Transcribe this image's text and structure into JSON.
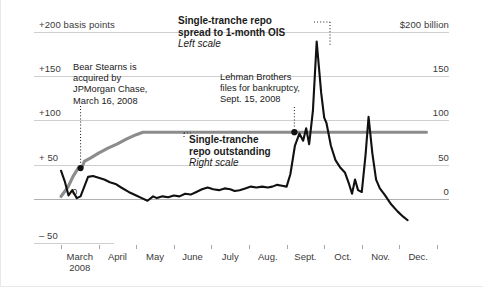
{
  "chart_data": {
    "type": "line",
    "title": "",
    "xlabel": "",
    "grid": true,
    "legend_position": "inline-annotations",
    "x_tick_labels": [
      "March\n2008",
      "April",
      "May",
      "June",
      "July",
      "Aug.",
      "Sept.",
      "Oct.",
      "Nov.",
      "Dec."
    ],
    "x_months": [
      "March",
      "April",
      "May",
      "June",
      "July",
      "Aug.",
      "Sept.",
      "Oct.",
      "Nov.",
      "Dec."
    ],
    "x_year_label": "2008",
    "left_axis": {
      "label": "basis points",
      "top_tick_label": "+200 basis points",
      "tick_labels": [
        "+200 basis points",
        "+150",
        "+100",
        "+ 50",
        "0",
        "– 50"
      ],
      "tick_values": [
        200,
        150,
        100,
        50,
        0,
        -50
      ],
      "ylim": [
        -50,
        200
      ],
      "unit": "basis points"
    },
    "right_axis": {
      "label": "$ billion",
      "top_tick_label": "$200 billion",
      "tick_labels": [
        "$200 billion",
        "150",
        "100",
        "50",
        "0"
      ],
      "tick_values": [
        200,
        150,
        100,
        50,
        0
      ],
      "ylim": [
        0,
        200
      ],
      "unit": "billions of dollars"
    },
    "series": [
      {
        "name": "Single-tranche repo spread to 1-month OIS",
        "scale": "left",
        "unit": "basis points",
        "color": "#111111",
        "label_line1": "Single-tranche repo",
        "label_line2": "spread to 1-month OIS",
        "label_scale": "Left scale",
        "points": [
          [
            0.0,
            32
          ],
          [
            0.1,
            20
          ],
          [
            0.2,
            4
          ],
          [
            0.3,
            10
          ],
          [
            0.42,
            1
          ],
          [
            0.52,
            3
          ],
          [
            0.62,
            14
          ],
          [
            0.72,
            25
          ],
          [
            0.85,
            26
          ],
          [
            1.0,
            24
          ],
          [
            1.15,
            22
          ],
          [
            1.3,
            19
          ],
          [
            1.45,
            17
          ],
          [
            1.6,
            13
          ],
          [
            1.8,
            8
          ],
          [
            2.0,
            4
          ],
          [
            2.15,
            1
          ],
          [
            2.3,
            -2
          ],
          [
            2.45,
            3
          ],
          [
            2.55,
            1
          ],
          [
            2.7,
            3
          ],
          [
            2.85,
            2
          ],
          [
            3.0,
            4
          ],
          [
            3.15,
            3
          ],
          [
            3.3,
            6
          ],
          [
            3.45,
            5
          ],
          [
            3.6,
            8
          ],
          [
            3.75,
            11
          ],
          [
            3.9,
            13
          ],
          [
            4.05,
            11
          ],
          [
            4.2,
            10
          ],
          [
            4.35,
            12
          ],
          [
            4.5,
            11
          ],
          [
            4.62,
            9
          ],
          [
            4.75,
            10
          ],
          [
            4.9,
            12
          ],
          [
            5.05,
            14
          ],
          [
            5.2,
            13
          ],
          [
            5.35,
            14
          ],
          [
            5.5,
            13
          ],
          [
            5.62,
            14
          ],
          [
            5.75,
            16
          ],
          [
            5.88,
            15
          ],
          [
            6.0,
            14
          ],
          [
            6.1,
            28
          ],
          [
            6.22,
            60
          ],
          [
            6.34,
            74
          ],
          [
            6.44,
            66
          ],
          [
            6.52,
            80
          ],
          [
            6.6,
            62
          ],
          [
            6.7,
            100
          ],
          [
            6.8,
            178
          ],
          [
            6.92,
            120
          ],
          [
            7.0,
            92
          ],
          [
            7.06,
            86
          ],
          [
            7.18,
            60
          ],
          [
            7.3,
            44
          ],
          [
            7.42,
            36
          ],
          [
            7.55,
            30
          ],
          [
            7.66,
            17
          ],
          [
            7.74,
            6
          ],
          [
            7.82,
            22
          ],
          [
            7.9,
            10
          ],
          [
            8.0,
            8
          ],
          [
            8.1,
            50
          ],
          [
            8.18,
            93
          ],
          [
            8.28,
            52
          ],
          [
            8.38,
            22
          ],
          [
            8.48,
            12
          ],
          [
            8.62,
            4
          ],
          [
            8.78,
            -6
          ],
          [
            8.95,
            -14
          ],
          [
            9.1,
            -20
          ],
          [
            9.22,
            -24
          ]
        ],
        "annotations": [
          {
            "text_lines": [
              "Bear Stearns is",
              "acquired by",
              "JPMorgan Chase,",
              "March 16, 2008"
            ],
            "marker_x": 0.52,
            "marker_value_right_scale": 37
          },
          {
            "text_lines": [
              "Lehman Brothers",
              "files for bankruptcy,",
              "Sept. 15, 2008"
            ],
            "marker_x": 6.34,
            "marker_value_right_scale": 80
          }
        ]
      },
      {
        "name": "Single-tranche repo outstanding",
        "scale": "right",
        "unit": "billions of dollars",
        "color": "#8c8c8c",
        "label_line1": "Single-tranche",
        "label_line2": "repo outstanding",
        "label_scale": "Right scale",
        "points": [
          [
            0.0,
            3
          ],
          [
            0.18,
            14
          ],
          [
            0.32,
            27
          ],
          [
            0.46,
            37
          ],
          [
            0.56,
            38
          ],
          [
            0.62,
            45
          ],
          [
            0.78,
            49
          ],
          [
            1.0,
            55
          ],
          [
            1.25,
            61
          ],
          [
            1.5,
            66
          ],
          [
            1.75,
            72
          ],
          [
            2.0,
            77
          ],
          [
            2.18,
            80
          ],
          [
            2.5,
            80
          ],
          [
            3.0,
            80
          ],
          [
            3.5,
            80
          ],
          [
            4.0,
            80
          ],
          [
            4.5,
            80
          ],
          [
            5.0,
            80
          ],
          [
            5.5,
            80
          ],
          [
            6.0,
            80
          ],
          [
            6.5,
            80
          ],
          [
            7.0,
            80
          ],
          [
            7.5,
            80
          ],
          [
            8.0,
            80
          ],
          [
            8.5,
            80
          ],
          [
            9.0,
            80
          ],
          [
            9.72,
            80
          ]
        ]
      }
    ]
  },
  "annotations": {
    "spread_label": {
      "line1": "Single-tranche repo",
      "line2": "spread to 1-month OIS",
      "scale_note": "Left scale"
    },
    "outstanding_label": {
      "line1": "Single-tranche",
      "line2": "repo outstanding",
      "scale_note": "Right scale"
    },
    "bear_stearns": {
      "line1": "Bear Stearns is",
      "line2": "acquired by",
      "line3": "JPMorgan Chase,",
      "line4": "March 16, 2008"
    },
    "lehman": {
      "line1": "Lehman Brothers",
      "line2": "files for bankruptcy,",
      "line3": "Sept. 15, 2008"
    }
  },
  "axes": {
    "left_ticks": [
      "+200 basis points",
      "+150",
      "+100",
      "+ 50",
      "0",
      "– 50"
    ],
    "right_ticks": [
      "$200 billion",
      "150",
      "100",
      "50",
      "0"
    ],
    "months": [
      "March",
      "April",
      "May",
      "June",
      "July",
      "Aug.",
      "Sept.",
      "Oct.",
      "Nov.",
      "Dec."
    ],
    "year": "2008"
  },
  "colors": {
    "spread_line": "#111111",
    "outstanding_line": "#8c8c8c",
    "gridline": "#cfcfcf",
    "text": "#1a1a1a"
  }
}
